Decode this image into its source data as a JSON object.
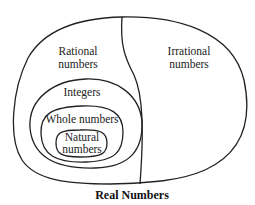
{
  "diagram": {
    "title": "Real Numbers",
    "regions": {
      "rational": {
        "line1": "Rational",
        "line2": "numbers"
      },
      "irrational": {
        "line1": "Irrational",
        "line2": "numbers"
      },
      "integers": {
        "label": "Integers"
      },
      "whole": {
        "label": "Whole numbers"
      },
      "natural": {
        "line1": "Natural",
        "line2": "numbers"
      }
    },
    "colors": {
      "stroke": "#222222",
      "background": "#ffffff"
    }
  }
}
